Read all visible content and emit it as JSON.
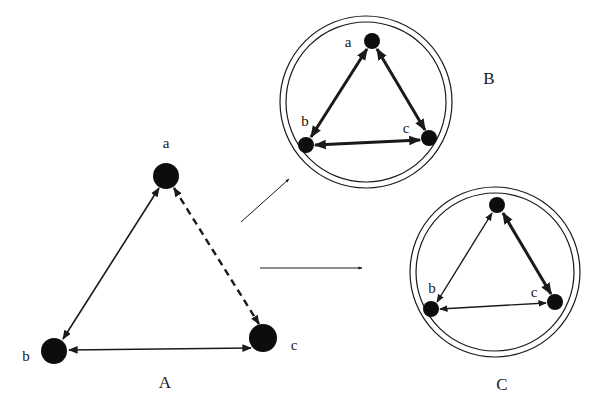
{
  "diagrams": {
    "A": {
      "caption": "A",
      "nodes": [
        {
          "id": "a",
          "label": "a",
          "x": 166,
          "y": 176,
          "r": 13
        },
        {
          "id": "b",
          "label": "b",
          "x": 54,
          "y": 351,
          "r": 13
        },
        {
          "id": "c",
          "label": "c",
          "x": 263,
          "y": 338,
          "r": 14
        }
      ],
      "edges": [
        {
          "from": "a",
          "to": "b",
          "style": "solid",
          "weight": "thin",
          "bidirectional": true
        },
        {
          "from": "a",
          "to": "c",
          "style": "dashed",
          "weight": "medium",
          "bidirectional": true
        },
        {
          "from": "b",
          "to": "c",
          "style": "solid",
          "weight": "thin",
          "bidirectional": true
        }
      ]
    },
    "B": {
      "caption": "B",
      "nodes": [
        {
          "id": "a",
          "label": "a",
          "x": 372,
          "y": 41,
          "r": 8
        },
        {
          "id": "b",
          "label": "b",
          "x": 306,
          "y": 145,
          "r": 8
        },
        {
          "id": "c",
          "label": "c",
          "x": 429,
          "y": 138,
          "r": 8
        }
      ],
      "edges": [
        {
          "from": "a",
          "to": "b",
          "style": "solid",
          "weight": "thick",
          "bidirectional": true
        },
        {
          "from": "a",
          "to": "c",
          "style": "solid",
          "weight": "thick",
          "bidirectional": true
        },
        {
          "from": "b",
          "to": "c",
          "style": "solid",
          "weight": "thick",
          "bidirectional": true
        }
      ],
      "enclosure": "double-circle"
    },
    "C": {
      "caption": "C",
      "nodes": [
        {
          "id": "a",
          "label": "",
          "x": 497,
          "y": 205,
          "r": 8
        },
        {
          "id": "b",
          "label": "b",
          "x": 431,
          "y": 309,
          "r": 8
        },
        {
          "id": "c",
          "label": "c",
          "x": 555,
          "y": 302,
          "r": 8
        }
      ],
      "edges": [
        {
          "from": "a",
          "to": "b",
          "style": "solid",
          "weight": "thin",
          "bidirectional": true
        },
        {
          "from": "a",
          "to": "c",
          "style": "solid",
          "weight": "thick",
          "bidirectional": true
        },
        {
          "from": "b",
          "to": "c",
          "style": "solid",
          "weight": "thin",
          "bidirectional": true
        }
      ],
      "enclosure": "double-circle"
    }
  },
  "transitions": [
    {
      "from": "A",
      "to": "B"
    },
    {
      "from": "A",
      "to": "C"
    }
  ],
  "labels": {
    "A_a": "a",
    "A_b": "b",
    "A_c": "c",
    "A_caption": "A",
    "B_a": "a",
    "B_b": "b",
    "B_c": "c",
    "B_caption": "B",
    "C_b": "b",
    "C_c": "c",
    "C_caption": "C"
  }
}
